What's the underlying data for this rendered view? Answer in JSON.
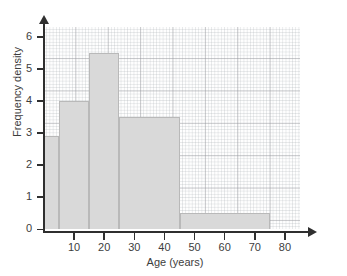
{
  "chart_data": {
    "type": "bar",
    "title": "",
    "subtitle": "",
    "xlabel": "Age (years)",
    "ylabel": "Frequency density",
    "xlim": [
      0,
      85
    ],
    "ylim": [
      0,
      6.3
    ],
    "grid": true,
    "legend": "none",
    "grid_style": "graph-paper",
    "bar_fill_color": "#d9d9d9",
    "bar_edge_color": "#b9b9b9",
    "axis_color": "#2f2f2f",
    "bin_edges": [
      0,
      5,
      15,
      25,
      45,
      75
    ],
    "bins": [
      {
        "label": "0-5",
        "x_start": 0,
        "x_end": 5,
        "density": 2.9
      },
      {
        "label": "5-15",
        "x_start": 5,
        "x_end": 15,
        "density": 4.0
      },
      {
        "label": "15-25",
        "x_start": 15,
        "x_end": 25,
        "density": 5.5
      },
      {
        "label": "25-45",
        "x_start": 25,
        "x_end": 45,
        "density": 3.5
      },
      {
        "label": "45-75",
        "x_start": 45,
        "x_end": 75,
        "density": 0.5
      }
    ],
    "values": [
      2.9,
      4.0,
      5.5,
      3.5,
      0.5
    ],
    "categories": [
      "0-5",
      "5-15",
      "15-25",
      "25-45",
      "45-75"
    ],
    "x_ticks": [
      {
        "value": 10,
        "label": "10"
      },
      {
        "value": 20,
        "label": "20"
      },
      {
        "value": 30,
        "label": "30"
      },
      {
        "value": 40,
        "label": "40"
      },
      {
        "value": 50,
        "label": "50"
      },
      {
        "value": 60,
        "label": "60"
      },
      {
        "value": 70,
        "label": "70"
      },
      {
        "value": 80,
        "label": "80"
      }
    ],
    "y_ticks": [
      {
        "value": 0,
        "label": "0"
      },
      {
        "value": 1,
        "label": "1"
      },
      {
        "value": 2,
        "label": "2"
      },
      {
        "value": 3,
        "label": "3"
      },
      {
        "value": 4,
        "label": "4"
      },
      {
        "value": 5,
        "label": "5"
      },
      {
        "value": 6,
        "label": "6"
      }
    ]
  }
}
